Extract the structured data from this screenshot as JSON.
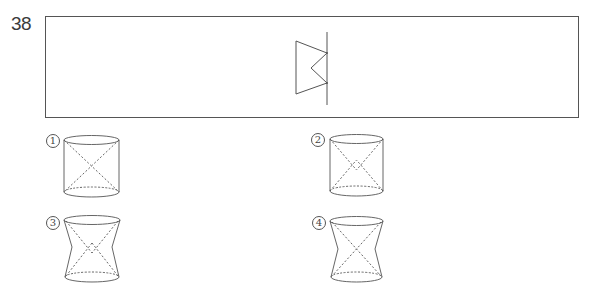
{
  "question": {
    "number": "38",
    "figure": {
      "description": "plane figure with rotation axis",
      "axis": {
        "x": 327,
        "y1": 32,
        "y2": 105
      },
      "polygon": [
        [
          296,
          41
        ],
        [
          327,
          53
        ],
        [
          311,
          68
        ],
        [
          327,
          83
        ],
        [
          296,
          94
        ]
      ]
    },
    "options": [
      {
        "label": "1",
        "glyph": "①",
        "shape": "cylinder",
        "inner": "x-cross"
      },
      {
        "label": "2",
        "glyph": "②",
        "shape": "cylinder",
        "inner": "x-cross-with-diamond"
      },
      {
        "label": "3",
        "glyph": "③",
        "shape": "pinched-solid",
        "inner": "x-cross-with-diamond"
      },
      {
        "label": "4",
        "glyph": "④",
        "shape": "pinched-solid",
        "inner": "x-cross"
      }
    ]
  },
  "colors": {
    "line": "#555555",
    "text": "#3a3a3a"
  }
}
